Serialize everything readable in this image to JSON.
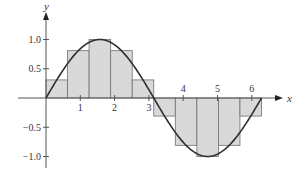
{
  "chart_data": {
    "type": "bar",
    "title": "",
    "function": "sin(x)",
    "interval": [
      0,
      6.2832
    ],
    "n_rectangles": 10,
    "rect_width": 0.6283,
    "categories": [
      "0–π/5",
      "π/5–2π/5",
      "2π/5–3π/5",
      "3π/5–4π/5",
      "4π/5–π",
      "π–6π/5",
      "6π/5–7π/5",
      "7π/5–8π/5",
      "8π/5–9π/5",
      "9π/5–2π"
    ],
    "x_left": [
      0,
      0.6283,
      1.2566,
      1.885,
      2.5133,
      3.1416,
      3.7699,
      4.3982,
      5.0265,
      5.6549
    ],
    "values": [
      0.309,
      0.809,
      1.0,
      0.809,
      0.309,
      -0.309,
      -0.809,
      -1.0,
      -0.809,
      -0.309
    ],
    "xlabel": "x",
    "ylabel": "y",
    "xticks": [
      1,
      2,
      3,
      4,
      5,
      6
    ],
    "xtick_labels": [
      "1",
      "2",
      "3",
      "4",
      "5",
      "6"
    ],
    "yticks": [
      1.0,
      0.5,
      -0.5,
      -1.0
    ],
    "ytick_labels": [
      "1.0",
      "0.5",
      "−0.5",
      "−1.0"
    ],
    "xlim": [
      0,
      6.8
    ],
    "ylim": [
      -1.2,
      1.3
    ],
    "grid": false,
    "legend": null
  },
  "colors": {
    "rect_fill": "#d9d9d9",
    "rect_stroke": "#707070",
    "curve": "#2e2e2e",
    "axis": "#555555"
  },
  "layout": {
    "origin_x": 46,
    "origin_y": 98,
    "px_per_x": 34.3,
    "px_per_y": 58.5
  }
}
